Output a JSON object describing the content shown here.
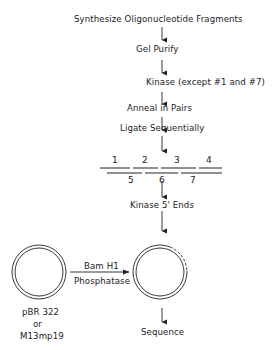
{
  "steps": {
    "synthesize": "Synthesize Oligonucleotide Fragments",
    "gel_purify": "Gel Purify",
    "kinase": "Kinase (except #1 and #7)",
    "anneal": "Anneal in Pairs",
    "ligate": "Ligate Sequentially",
    "kinase_ends": "Kinase 5' Ends",
    "sequence": "Sequence"
  },
  "fragments": {
    "top": [
      "1",
      "2",
      "3",
      "4"
    ],
    "bottom": [
      "5",
      "6",
      "7"
    ]
  },
  "vector": {
    "line1": "pBR 322",
    "line2": "or",
    "line3": "M13mp19"
  },
  "digest": {
    "enzyme": "Bam H1",
    "treatment": "Phosphatase"
  }
}
